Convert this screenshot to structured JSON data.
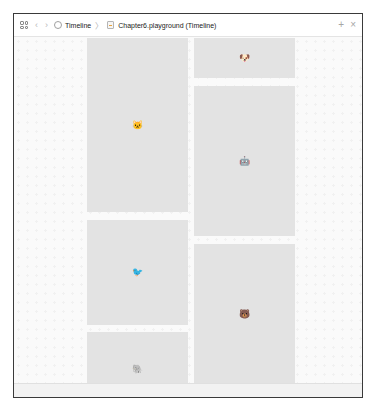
{
  "toolbar": {
    "grid_icon": "grid-icon",
    "back_icon": "‹",
    "forward_icon": "›",
    "breadcrumb": [
      {
        "label": "Timeline",
        "icon": "timeline-icon"
      },
      {
        "label": "Chapter6.playground (Timeline)",
        "icon": "playground-file-icon"
      }
    ],
    "separator": "〉",
    "add_icon": "+",
    "close_icon": "×"
  },
  "panels": [
    {
      "column": "left",
      "emoji": "🐱",
      "name": "cat"
    },
    {
      "column": "left",
      "emoji": "🐦",
      "name": "bird"
    },
    {
      "column": "left",
      "emoji": "🐘",
      "name": "elephant"
    },
    {
      "column": "right",
      "emoji": "🐶",
      "name": "dog"
    },
    {
      "column": "right",
      "emoji": "🤖",
      "name": "robot"
    },
    {
      "column": "right",
      "emoji": "🐻",
      "name": "bear"
    }
  ],
  "colors": {
    "panel_bg": "#e3e3e3",
    "canvas_bg": "#fafafa",
    "frame": "#3a3a3a"
  }
}
